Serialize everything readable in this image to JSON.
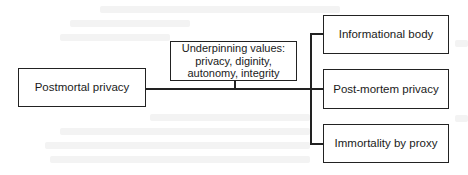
{
  "diagram": {
    "root": {
      "label": "Postmortal privacy"
    },
    "values": {
      "label": "Underpinning values: privacy, diginity, autonomy, integrity"
    },
    "branches": [
      {
        "label": "Informational body"
      },
      {
        "label": "Post-mortem privacy"
      },
      {
        "label": "Immortality by proxy"
      }
    ],
    "colors": {
      "border": "#222222",
      "background": "#ffffff"
    }
  }
}
